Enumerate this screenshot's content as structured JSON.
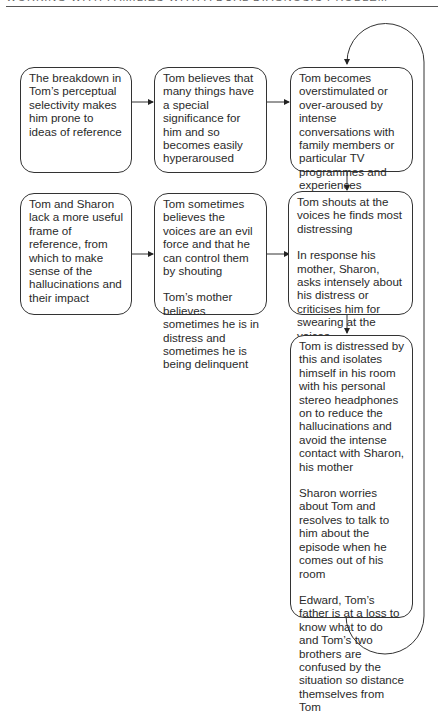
{
  "page": {
    "header_text": "WORKING WITH FAMILIES WITH A DUAL DIAGNOSIS PROBLEM"
  },
  "diagram": {
    "type": "flowchart",
    "boxes": [
      {
        "id": "b1",
        "paragraphs": [
          "The breakdown in Tom’s perceptual selectivity makes him prone to ideas of reference"
        ]
      },
      {
        "id": "b2",
        "paragraphs": [
          "Tom believes that many things have a special significance for him and  so becomes easily hyperaroused"
        ]
      },
      {
        "id": "b3",
        "paragraphs": [
          "Tom becomes overstimulated or over-aroused by intense conversations with family members or particular TV programmes and experiences auditory hallucinations"
        ]
      },
      {
        "id": "b4",
        "paragraphs": [
          "Tom and Sharon lack a more useful frame of reference, from which to make sense of the hallucinations and their impact"
        ]
      },
      {
        "id": "b5",
        "paragraphs": [
          "Tom sometimes believes the voices are an evil force and that he can control them by shouting",
          "Tom’s mother believes sometimes he is in distress and sometimes he is being delinquent"
        ]
      },
      {
        "id": "b6",
        "paragraphs": [
          "Tom shouts at the voices he finds most distressing",
          "In response his mother, Sharon, asks intensely about his distress or criticises him for swearing at the voices"
        ]
      },
      {
        "id": "b7",
        "paragraphs": [
          "Tom is distressed by this and isolates himself in his room with his personal stereo headphones on to reduce the hallucinations and avoid the intense contact with Sharon, his mother",
          "Sharon worries about Tom and resolves to talk to him about the episode when he comes out of his room",
          "Edward, Tom’s father is at a loss to know what to do and Tom’s two brothers are confused by the situation so distance themselves from Tom"
        ]
      }
    ],
    "edges": [
      {
        "from": "b1",
        "to": "b2"
      },
      {
        "from": "b2",
        "to": "b3"
      },
      {
        "from": "b3",
        "to": "b6"
      },
      {
        "from": "b4",
        "to": "b5"
      },
      {
        "from": "b5",
        "to": "b6"
      },
      {
        "from": "b6",
        "to": "b7"
      },
      {
        "from": "b7",
        "to": "b3",
        "style": "feedback-loop"
      }
    ]
  }
}
